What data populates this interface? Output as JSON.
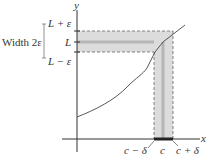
{
  "diagram": {
    "axes": {
      "x_label": "x",
      "y_label": "y"
    },
    "y_ticks": {
      "upper": "L + ε",
      "middle": "L",
      "lower": "L − ε"
    },
    "x_ticks": {
      "left": "c − δ",
      "middle": "c",
      "right": "c + δ"
    },
    "width_label": "Width 2ε",
    "colors": {
      "band": "#d9d9d9",
      "band_center": "#bdbdbd",
      "axis": "#333333",
      "curve": "#444444",
      "x_interval": "#333333"
    }
  }
}
